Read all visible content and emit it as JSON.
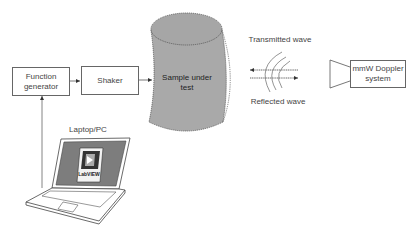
{
  "diagram": {
    "nodes": {
      "function_generator": {
        "line1": "Function",
        "line2": "generator"
      },
      "shaker": {
        "label": "Shaker"
      },
      "sample": {
        "line1": "Sample under",
        "line2": "test"
      },
      "doppler": {
        "line1": "mmW Doppler",
        "line2": "system"
      },
      "laptop": {
        "label": "Laptop/PC",
        "screen_logo": "LabVIEW"
      }
    },
    "wave_labels": {
      "transmitted": "Transmitted wave",
      "reflected": "Reflected wave"
    },
    "edges": [
      {
        "from": "laptop",
        "to": "function_generator"
      },
      {
        "from": "function_generator",
        "to": "shaker"
      },
      {
        "from": "shaker",
        "to": "sample"
      },
      {
        "from": "doppler",
        "to": "sample",
        "label": "Transmitted wave"
      },
      {
        "from": "sample",
        "to": "doppler",
        "label": "Reflected wave"
      }
    ],
    "colors": {
      "cylinder_fill": "#a9a9a9",
      "line": "#555555",
      "screen_fill": "#7d7d7d"
    }
  }
}
